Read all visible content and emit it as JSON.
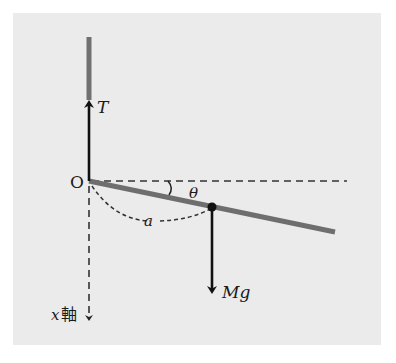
{
  "diagram": {
    "labels": {
      "origin": "O",
      "tension": "T",
      "angle": "θ",
      "distance": "a",
      "weight": "Mg",
      "axis_var": "x",
      "axis_suffix": "軸"
    },
    "colors": {
      "background": "#ebebeb",
      "rod": "#707070",
      "arrow": "#111111",
      "dashed": "#333333"
    }
  }
}
